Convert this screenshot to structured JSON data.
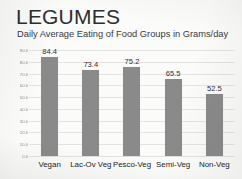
{
  "slide": {
    "title": "LEGUMES",
    "subtitle": "Daily Average Eating of Food Groups in Grams/day"
  },
  "colors": {
    "bar": "#8a8a8a",
    "background": "#fbfbfa",
    "gridline": "#e4e3e1",
    "title_text": "#2e2e2e",
    "tick_text": "#8e8e8e"
  },
  "chart_data": {
    "type": "bar",
    "title": "LEGUMES",
    "subtitle": "Daily Average Eating of Food Groups in Grams/day",
    "categories": [
      "Vegan",
      "Lac-Ov Veg",
      "Pesco-Veg",
      "Semi-Veg",
      "Non-Veg"
    ],
    "values": [
      84.4,
      73.4,
      75.2,
      65.5,
      52.5
    ],
    "data_labels": [
      "84.4",
      "73.4",
      "75.2",
      "65.5",
      "52.5"
    ],
    "xlabel": "",
    "ylabel": "",
    "ylim": [
      0.0,
      90.0
    ],
    "ytick_labels": [
      "90.0",
      "80.0",
      "70.0",
      "60.0",
      "50.0",
      "40.0",
      "30.0",
      "20.0",
      "10.0",
      "0.0"
    ],
    "ytick_values": [
      90.0,
      80.0,
      70.0,
      60.0,
      50.0,
      40.0,
      30.0,
      20.0,
      10.0,
      0.0
    ],
    "grid": true,
    "legend": false,
    "legend_position": "none"
  }
}
